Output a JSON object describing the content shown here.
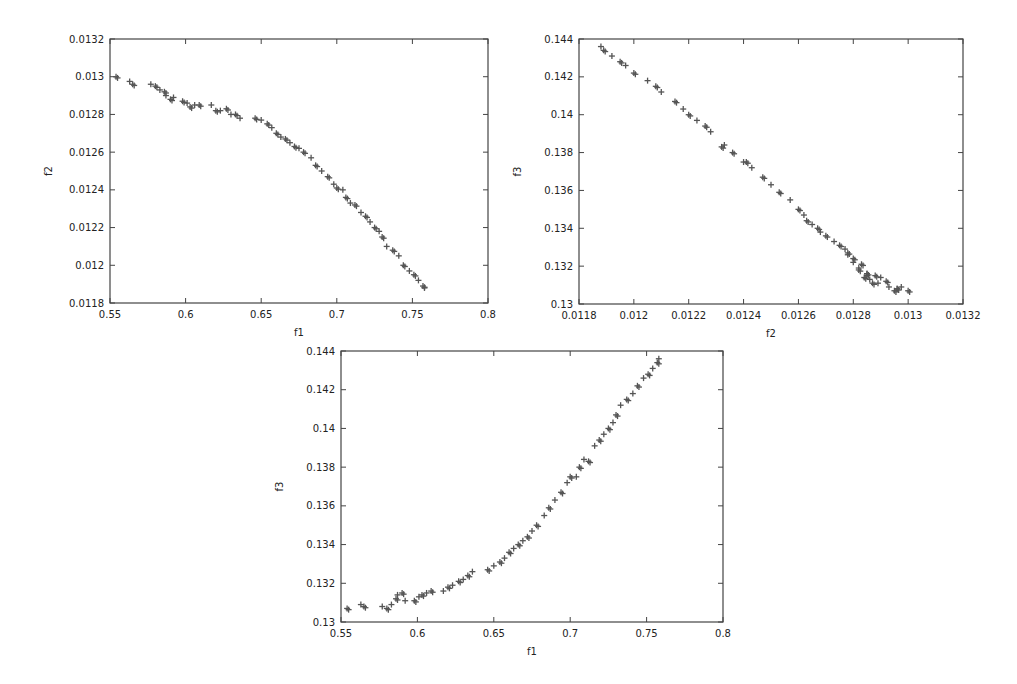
{
  "figure": {
    "background": "#ffffff",
    "axis_color": "#444444",
    "marker_color": "#555555",
    "marker": "+"
  },
  "chart_data": [
    {
      "id": "f1_vs_f2",
      "type": "scatter",
      "title": "",
      "xlabel": "f1",
      "ylabel": "f2",
      "xlim": [
        0.55,
        0.8
      ],
      "ylim": [
        0.0118,
        0.0132
      ],
      "xticks": [
        "0.55",
        "0.6",
        "0.65",
        "0.7",
        "0.75",
        "0.8"
      ],
      "yticks": [
        "0.0118",
        "0.012",
        "0.0122",
        "0.0124",
        "0.0126",
        "0.0128",
        "0.013",
        "0.0132"
      ],
      "grid": false,
      "legend": null,
      "x_key": "f1",
      "y_key": "f2",
      "box": {
        "left": 110,
        "top": 39,
        "right": 488,
        "bottom": 303
      }
    },
    {
      "id": "f2_vs_f3",
      "type": "scatter",
      "title": "",
      "xlabel": "f2",
      "ylabel": "f3",
      "xlim": [
        0.0118,
        0.0132
      ],
      "ylim": [
        0.13,
        0.144
      ],
      "xticks": [
        "0.0118",
        "0.012",
        "0.0122",
        "0.0124",
        "0.0126",
        "0.0128",
        "0.013",
        "0.0132"
      ],
      "yticks": [
        "0.13",
        "0.132",
        "0.134",
        "0.136",
        "0.138",
        "0.14",
        "0.142",
        "0.144"
      ],
      "grid": false,
      "legend": null,
      "x_key": "f2",
      "y_key": "f3",
      "box": {
        "left": 579,
        "top": 39,
        "right": 963,
        "bottom": 304
      }
    },
    {
      "id": "f1_vs_f3",
      "type": "scatter",
      "title": "",
      "xlabel": "f1",
      "ylabel": "f3",
      "xlim": [
        0.55,
        0.8
      ],
      "ylim": [
        0.13,
        0.144
      ],
      "xticks": [
        "0.55",
        "0.6",
        "0.65",
        "0.7",
        "0.75",
        "0.8"
      ],
      "yticks": [
        "0.13",
        "0.132",
        "0.134",
        "0.136",
        "0.138",
        "0.14",
        "0.142",
        "0.144"
      ],
      "grid": false,
      "legend": null,
      "x_key": "f1",
      "y_key": "f3",
      "box": {
        "left": 341,
        "top": 351,
        "right": 723,
        "bottom": 622
      }
    }
  ],
  "points": {
    "fields": [
      "f1",
      "f2",
      "f3"
    ],
    "values": [
      [
        0.554,
        0.013,
        0.1307
      ],
      [
        0.563,
        0.012975,
        0.1309
      ],
      [
        0.565,
        0.01296,
        0.1308
      ],
      [
        0.577,
        0.01296,
        0.1308
      ],
      [
        0.58,
        0.01295,
        0.1307
      ],
      [
        0.583,
        0.01293,
        0.1309
      ],
      [
        0.586,
        0.01292,
        0.1312
      ],
      [
        0.587,
        0.0129,
        0.1314
      ],
      [
        0.59,
        0.01288,
        0.1315
      ],
      [
        0.592,
        0.01289,
        0.1311
      ],
      [
        0.598,
        0.01287,
        0.1311
      ],
      [
        0.601,
        0.01286,
        0.1313
      ],
      [
        0.603,
        0.01284,
        0.1314
      ],
      [
        0.606,
        0.01285,
        0.1315
      ],
      [
        0.609,
        0.01285,
        0.1316
      ],
      [
        0.617,
        0.01285,
        0.1316
      ],
      [
        0.62,
        0.01282,
        0.1318
      ],
      [
        0.623,
        0.01282,
        0.1319
      ],
      [
        0.627,
        0.01283,
        0.1321
      ],
      [
        0.63,
        0.0128,
        0.1322
      ],
      [
        0.633,
        0.0128,
        0.1324
      ],
      [
        0.636,
        0.01278,
        0.1326
      ],
      [
        0.646,
        0.01278,
        0.1327
      ],
      [
        0.65,
        0.01277,
        0.1329
      ],
      [
        0.654,
        0.01275,
        0.1331
      ],
      [
        0.657,
        0.01273,
        0.1333
      ],
      [
        0.66,
        0.0127,
        0.1336
      ],
      [
        0.663,
        0.01268,
        0.1338
      ],
      [
        0.666,
        0.01267,
        0.134
      ],
      [
        0.669,
        0.01265,
        0.1342
      ],
      [
        0.672,
        0.01263,
        0.1344
      ],
      [
        0.675,
        0.01262,
        0.1347
      ],
      [
        0.678,
        0.0126,
        0.135
      ],
      [
        0.683,
        0.01257,
        0.1355
      ],
      [
        0.686,
        0.01253,
        0.1359
      ],
      [
        0.69,
        0.0125,
        0.1363
      ],
      [
        0.694,
        0.01247,
        0.1367
      ],
      [
        0.698,
        0.01243,
        0.1372
      ],
      [
        0.7,
        0.01241,
        0.1375
      ],
      [
        0.704,
        0.0124,
        0.1375
      ],
      [
        0.706,
        0.01236,
        0.138
      ],
      [
        0.709,
        0.01233,
        0.1384
      ],
      [
        0.712,
        0.01232,
        0.1383
      ],
      [
        0.716,
        0.01228,
        0.1391
      ],
      [
        0.719,
        0.01226,
        0.1394
      ],
      [
        0.722,
        0.01223,
        0.1397
      ],
      [
        0.725,
        0.0122,
        0.14
      ],
      [
        0.728,
        0.01218,
        0.1403
      ],
      [
        0.73,
        0.01215,
        0.1407
      ],
      [
        0.733,
        0.0121,
        0.1412
      ],
      [
        0.737,
        0.01208,
        0.1415
      ],
      [
        0.741,
        0.01205,
        0.1418
      ],
      [
        0.744,
        0.012,
        0.1422
      ],
      [
        0.748,
        0.01197,
        0.1426
      ],
      [
        0.751,
        0.01195,
        0.1428
      ],
      [
        0.754,
        0.01192,
        0.1431
      ],
      [
        0.757,
        0.01189,
        0.1434
      ],
      [
        0.758,
        0.01188,
        0.1436
      ]
    ]
  }
}
